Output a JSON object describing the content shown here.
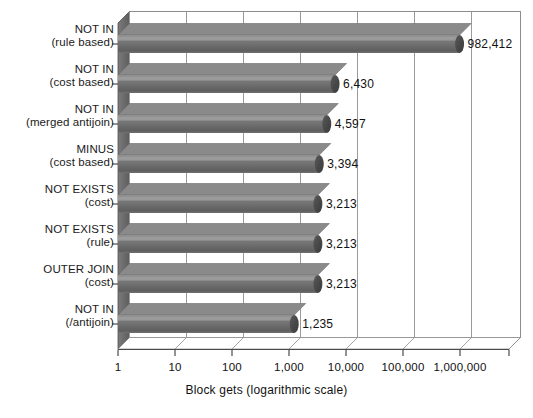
{
  "chart_data": {
    "type": "bar",
    "orientation": "horizontal",
    "title": "",
    "xlabel": "Block gets (logarithmic scale)",
    "ylabel": "",
    "scale": "log",
    "grid": true,
    "legend": "none",
    "xlim": [
      1,
      10000000
    ],
    "xticks": [
      1,
      10,
      100,
      1000,
      10000,
      100000,
      1000000
    ],
    "xtick_labels": [
      "1",
      "10",
      "100",
      "1,000",
      "10,000",
      "100,000",
      "1,000,000"
    ],
    "categories": [
      "NOT IN (rule based)",
      "NOT IN (cost based)",
      "NOT IN (merged antijoin)",
      "MINUS (cost based)",
      "NOT EXISTS (cost)",
      "NOT EXISTS (rule)",
      "OUTER JOIN (cost)",
      "NOT IN (/antijoin)"
    ],
    "category_lines": [
      [
        "NOT IN",
        "(rule based)"
      ],
      [
        "NOT IN",
        "(cost based)"
      ],
      [
        "NOT IN",
        "(merged antijoin)"
      ],
      [
        "MINUS",
        "(cost based)"
      ],
      [
        "NOT EXISTS",
        "(cost)"
      ],
      [
        "NOT EXISTS",
        "(rule)"
      ],
      [
        "OUTER JOIN",
        "(cost)"
      ],
      [
        "NOT IN",
        "(/antijoin)"
      ]
    ],
    "values": [
      982412,
      6430,
      4597,
      3394,
      3213,
      3213,
      3213,
      1235
    ],
    "value_labels": [
      "982,412",
      "6,430",
      "4,597",
      "3,394",
      "3,213",
      "3,213",
      "3,213",
      "1,235"
    ],
    "colors": {
      "bar_fill": "#6e6e6e",
      "bar_highlight": "#8f8f8f",
      "bar_shadow": "#4f4f4f",
      "bar_cap": "#4a4a4a",
      "grid": "#9a9a9a",
      "axis": "#4a4a4a",
      "wall_side": "#6a6a6a",
      "plot_bg": "#ffffff",
      "text": "#111111"
    }
  }
}
